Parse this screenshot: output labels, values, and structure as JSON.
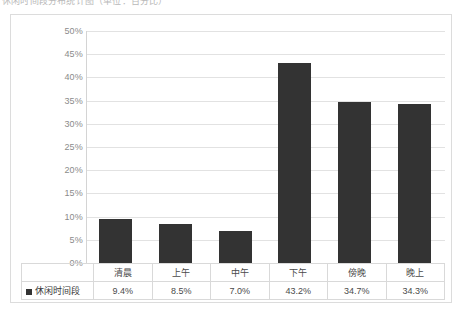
{
  "caption": {
    "text": "休闲时间段分布统计图（单位：百分比）"
  },
  "chart_data": {
    "type": "bar",
    "title": "",
    "xlabel": "",
    "ylabel": "",
    "categories": [
      "清晨",
      "上午",
      "中午",
      "下午",
      "傍晚",
      "晚上"
    ],
    "series": [
      {
        "name": "休闲时间段",
        "values": [
          9.4,
          8.5,
          7.0,
          43.2,
          34.7,
          34.3
        ],
        "value_labels": [
          "9.4%",
          "8.5%",
          "7.0%",
          "43.2%",
          "34.7%",
          "34.3%"
        ],
        "color": "#333333"
      }
    ],
    "ylim": [
      0,
      50
    ],
    "ytick_values": [
      0,
      5,
      10,
      15,
      20,
      25,
      30,
      35,
      40,
      45,
      50
    ],
    "ytick_labels": [
      "0%",
      "5%",
      "10%",
      "15%",
      "20%",
      "25%",
      "30%",
      "35%",
      "40%",
      "45%",
      "50%"
    ],
    "grid": true,
    "legend_position": "bottom-table",
    "gridline_color": "#e2e2e2",
    "frame_color": "#dcdcdc"
  },
  "table": {
    "legend_label": "休闲时间段"
  }
}
